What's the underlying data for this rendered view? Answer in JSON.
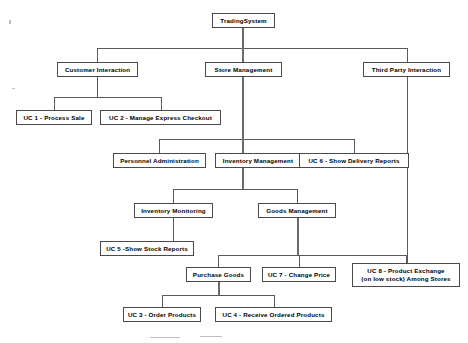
{
  "diagram": {
    "kind": "use-case-hierarchy-tree",
    "root": "TradingSystem",
    "nodes": [
      {
        "id": "trading-system",
        "label": "TradingSystem",
        "x": 212,
        "y": 13,
        "w": 63,
        "h": 15
      },
      {
        "id": "customer-interaction",
        "label": "Customer Interaction",
        "x": 57,
        "y": 62,
        "w": 81,
        "h": 15
      },
      {
        "id": "store-management",
        "label": "Store Management",
        "x": 205,
        "y": 62,
        "w": 77,
        "h": 15
      },
      {
        "id": "third-party-interaction",
        "label": "Third Party Interaction",
        "x": 363,
        "y": 62,
        "w": 87,
        "h": 15
      },
      {
        "id": "uc-1-process-sale",
        "label": "UC 1 - Process Sale",
        "x": 16,
        "y": 110,
        "w": 76,
        "h": 15
      },
      {
        "id": "uc-2-manage-express",
        "label": "UC 2 - Manage Express Checkout",
        "x": 100,
        "y": 110,
        "w": 121,
        "h": 15
      },
      {
        "id": "personnel-administration",
        "label": "Personnel Administration",
        "x": 113,
        "y": 153,
        "w": 93,
        "h": 15
      },
      {
        "id": "inventory-management",
        "label": "Inventory Management",
        "x": 215,
        "y": 153,
        "w": 86,
        "h": 15
      },
      {
        "id": "uc-6-delivery-reports",
        "label": "UC 6 - Show Delivery Reports",
        "x": 299,
        "y": 153,
        "w": 110,
        "h": 15
      },
      {
        "id": "inventory-monitoring",
        "label": "Inventory Monitoring",
        "x": 134,
        "y": 203,
        "w": 79,
        "h": 15
      },
      {
        "id": "goods-management",
        "label": "Goods Management",
        "x": 258,
        "y": 203,
        "w": 78,
        "h": 15
      },
      {
        "id": "uc-5-stock-reports",
        "label": "UC 5 -Show Stock Reports",
        "x": 100,
        "y": 241,
        "w": 94,
        "h": 15
      },
      {
        "id": "purchase-goods",
        "label": "Purchase Goods",
        "x": 186,
        "y": 267,
        "w": 65,
        "h": 15
      },
      {
        "id": "uc-7-change-price",
        "label": "UC 7 - Change Price",
        "x": 262,
        "y": 267,
        "w": 74,
        "h": 15
      },
      {
        "id": "uc-8-product-exchange",
        "label": "UC 8 - Product Exchange\n(on low stock) Among Stores",
        "x": 352,
        "y": 263,
        "w": 108,
        "h": 24
      },
      {
        "id": "uc-3-order-products",
        "label": "UC 3 - Order Products",
        "x": 123,
        "y": 307,
        "w": 78,
        "h": 15
      },
      {
        "id": "uc-4-receive-ordered",
        "label": "UC 4 - Receive Ordered Products",
        "x": 215,
        "y": 307,
        "w": 117,
        "h": 15
      }
    ],
    "edges": [
      {
        "from": "trading-system",
        "to": "customer-interaction"
      },
      {
        "from": "trading-system",
        "to": "store-management"
      },
      {
        "from": "trading-system",
        "to": "third-party-interaction"
      },
      {
        "from": "customer-interaction",
        "to": "uc-1-process-sale"
      },
      {
        "from": "customer-interaction",
        "to": "uc-2-manage-express"
      },
      {
        "from": "store-management",
        "to": "personnel-administration"
      },
      {
        "from": "store-management",
        "to": "inventory-management"
      },
      {
        "from": "store-management",
        "to": "uc-6-delivery-reports"
      },
      {
        "from": "inventory-management",
        "to": "inventory-monitoring"
      },
      {
        "from": "inventory-management",
        "to": "goods-management"
      },
      {
        "from": "inventory-monitoring",
        "to": "uc-5-stock-reports"
      },
      {
        "from": "goods-management",
        "to": "purchase-goods"
      },
      {
        "from": "goods-management",
        "to": "uc-7-change-price"
      },
      {
        "from": "goods-management",
        "to": "uc-8-product-exchange"
      },
      {
        "from": "third-party-interaction",
        "to": "uc-8-product-exchange"
      },
      {
        "from": "purchase-goods",
        "to": "uc-3-order-products"
      },
      {
        "from": "purchase-goods",
        "to": "uc-4-receive-ordered"
      }
    ],
    "colors": {
      "background": "#ffffff",
      "box_border": "#4a4a4a",
      "connector": "#5a5a5a",
      "text": "#000000"
    }
  }
}
